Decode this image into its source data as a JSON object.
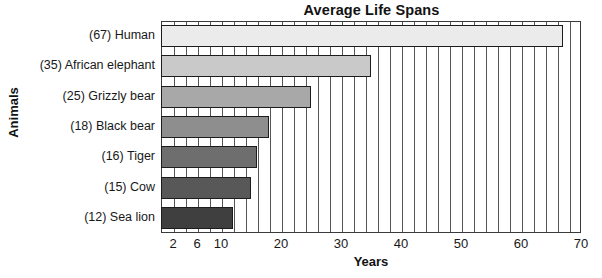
{
  "chart_data": {
    "type": "bar",
    "orientation": "horizontal",
    "title": "Average Life Spans",
    "xlabel": "Years",
    "ylabel": "Animals",
    "categories": [
      "(67) Human",
      "(35) African elephant",
      "(25) Grizzly bear",
      "(18) Black bear",
      "(16) Tiger",
      "(15) Cow",
      "(12) Sea lion"
    ],
    "values": [
      67,
      35,
      25,
      18,
      16,
      15,
      12
    ],
    "bar_colors": [
      "#ebebeb",
      "#c9c9c9",
      "#a8a8a8",
      "#8e8e8e",
      "#6e6e6e",
      "#585858",
      "#3f3f3f"
    ],
    "bar_border_color": "#1c1c1c",
    "xlim": [
      0,
      70
    ],
    "xtick_labels": [
      "2",
      "6",
      "10",
      "20",
      "30",
      "40",
      "50",
      "60",
      "70"
    ],
    "xtick_values": [
      2,
      6,
      10,
      20,
      30,
      40,
      50,
      60,
      70
    ],
    "gridline_values": [
      2,
      4,
      6,
      8,
      10,
      12,
      14,
      16,
      18,
      20,
      22,
      24,
      26,
      28,
      30,
      32,
      34,
      36,
      38,
      40,
      42,
      44,
      46,
      48,
      50,
      52,
      54,
      56,
      58,
      60,
      62,
      64,
      66,
      68
    ],
    "grid": true,
    "grid_axis": "x",
    "legend": false,
    "frame_color": "#3a3a3a",
    "background": "#ffffff"
  }
}
